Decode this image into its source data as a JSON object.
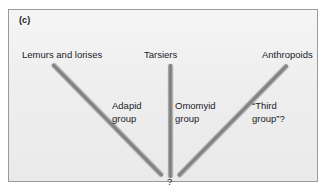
{
  "figure": {
    "panel_caption": "(c)",
    "convergence_marker": "?"
  },
  "taxa": [
    {
      "name": "lemurs-and-lorises",
      "label": "Lemurs and lorises"
    },
    {
      "name": "tarsiers",
      "label": "Tarsiers"
    },
    {
      "name": "anthropoids",
      "label": "Anthropoids"
    }
  ],
  "groups": [
    {
      "name": "adapid-group",
      "line1": "Adapid",
      "line2": "group"
    },
    {
      "name": "omomyid-group",
      "line1": "Omomyid",
      "line2": "group"
    },
    {
      "name": "third-group",
      "line1": "“Third",
      "line2": "group”?"
    }
  ],
  "colors": {
    "page_background": "#ffffff",
    "panel_background": "#f0f0f0",
    "panel_border": "#9a9a9a",
    "bar_fill": "#7b7b7b",
    "bar_highlight": "#c2c2c2",
    "text": "#1a1a2a"
  }
}
